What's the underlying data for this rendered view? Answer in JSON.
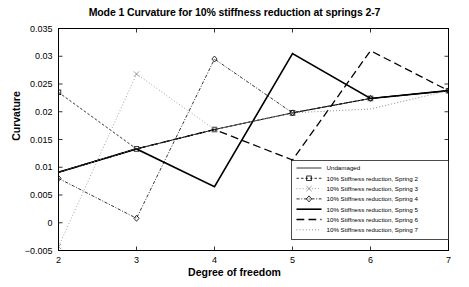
{
  "chart_data": {
    "type": "line",
    "title": "Mode 1 Curvature for 10% stiffness reduction at springs 2-7",
    "xlabel": "Degree of freedom",
    "ylabel": "Curvature",
    "x": [
      2,
      3,
      4,
      5,
      6,
      7
    ],
    "xlim": [
      2,
      7
    ],
    "ylim": [
      -0.005,
      0.035
    ],
    "xticks": [
      "2",
      "3",
      "4",
      "5",
      "6",
      "7"
    ],
    "yticks": [
      "-0.005",
      "0",
      "0.005",
      "0.01",
      "0.015",
      "0.02",
      "0.025",
      "0.03",
      "0.035"
    ],
    "grid": false,
    "legend_position": "lower right",
    "series": [
      {
        "name": "Undamaged",
        "style": "solid",
        "marker": "none",
        "color": "#000000",
        "width": 0.8,
        "values": [
          0.0091,
          0.0133,
          0.0168,
          0.0198,
          0.0224,
          0.0238
        ]
      },
      {
        "name": "10% Stiffness reduction, Spring 2",
        "style": "dashed",
        "marker": "square",
        "color": "#000000",
        "width": 0.8,
        "values": [
          0.0235,
          0.0133,
          0.0168,
          0.0198,
          0.0224,
          0.0238
        ]
      },
      {
        "name": "10% Stiffness reduction, Spring 3",
        "style": "dotted",
        "marker": "cross",
        "color": "#808080",
        "width": 0.8,
        "values": [
          -0.0043,
          0.0268,
          0.0168,
          0.0198,
          0.0224,
          0.0238
        ]
      },
      {
        "name": "10% Stiffness reduction, Spring 4",
        "style": "dashdot",
        "marker": "diamond",
        "color": "#000000",
        "width": 0.8,
        "values": [
          0.008,
          0.0008,
          0.0295,
          0.0198,
          0.0224,
          0.0238
        ]
      },
      {
        "name": "10% Stiffness reduction, Spring 5",
        "style": "solid",
        "marker": "none",
        "color": "#000000",
        "width": 1.6,
        "values": [
          0.0091,
          0.0133,
          0.0065,
          0.0305,
          0.0224,
          0.0238
        ]
      },
      {
        "name": "10% Stiffness reduction, Spring 6",
        "style": "longdash",
        "marker": "none",
        "color": "#000000",
        "width": 1.3,
        "values": [
          0.0091,
          0.0133,
          0.0168,
          0.0113,
          0.031,
          0.0238
        ]
      },
      {
        "name": "10% Stiffness reduction, Spring 7",
        "style": "dotted",
        "marker": "none",
        "color": "#707070",
        "width": 0.9,
        "values": [
          0.0091,
          0.0133,
          0.0168,
          0.0198,
          0.0205,
          0.0238
        ]
      }
    ]
  },
  "axes": {
    "frame_color": "#000000",
    "background": "#ffffff"
  }
}
